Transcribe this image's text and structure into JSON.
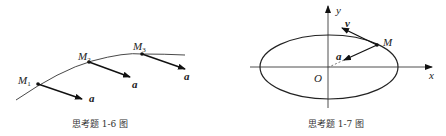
{
  "figures": [
    {
      "id": "fig-1-6",
      "caption": "思考题 1-6 图",
      "points": [
        {
          "label": "M",
          "sub": "1",
          "vector": "a"
        },
        {
          "label": "M",
          "sub": "2",
          "vector": "a"
        },
        {
          "label": "M",
          "sub": "3",
          "vector": "a"
        }
      ]
    },
    {
      "id": "fig-1-7",
      "caption": "思考题 1-7 图",
      "axes": {
        "x": "x",
        "y": "y",
        "origin": "O"
      },
      "point": "M",
      "vectors": {
        "velocity": "v",
        "acceleration": "a"
      }
    }
  ]
}
